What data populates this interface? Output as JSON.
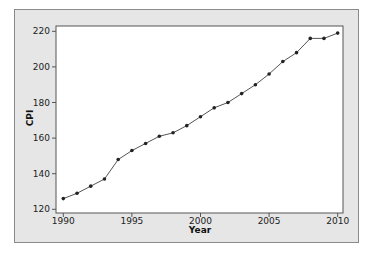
{
  "chart_data": {
    "type": "line",
    "title": "",
    "xlabel": "Year",
    "ylabel": "CPI",
    "x": [
      1990,
      1991,
      1992,
      1993,
      1994,
      1995,
      1996,
      1997,
      1998,
      1999,
      2000,
      2001,
      2002,
      2003,
      2004,
      2005,
      2006,
      2007,
      2008,
      2009,
      2010
    ],
    "series": [
      {
        "name": "CPI",
        "values": [
          126,
          129,
          133,
          137,
          148,
          153,
          157,
          161,
          163,
          167,
          172,
          177,
          180,
          185,
          190,
          196,
          203,
          208,
          216,
          216,
          219
        ]
      }
    ],
    "xlim": [
      1990,
      2010
    ],
    "ylim": [
      120,
      220
    ],
    "x_ticks": [
      "1990",
      "1995",
      "2000",
      "2005",
      "2010"
    ],
    "y_ticks": [
      "120",
      "140",
      "160",
      "180",
      "200",
      "220"
    ],
    "grid": false,
    "legend": "none",
    "marker": "filled-circle",
    "colors": {
      "line": "#555555",
      "marker": "#222222",
      "frame_bg": "#e6e6e6",
      "plot_bg": "#ffffff"
    }
  }
}
